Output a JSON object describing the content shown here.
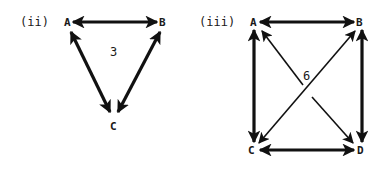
{
  "diagrams": [
    {
      "id": "ii",
      "label": "(ii)",
      "nodes": [
        {
          "name": "A",
          "x": 68,
          "y": 26
        },
        {
          "name": "B",
          "x": 163,
          "y": 26
        },
        {
          "name": "C",
          "x": 114,
          "y": 130
        }
      ],
      "edges": [
        {
          "from": "A",
          "to": "B",
          "bidirectional": true,
          "weight": "thick"
        },
        {
          "from": "A",
          "to": "C",
          "bidirectional": true,
          "weight": "thick"
        },
        {
          "from": "B",
          "to": "C",
          "bidirectional": true,
          "weight": "thick"
        }
      ],
      "center_number": "3"
    },
    {
      "id": "iii",
      "label": "(iii)",
      "nodes": [
        {
          "name": "A",
          "x": 254,
          "y": 26
        },
        {
          "name": "B",
          "x": 360,
          "y": 26
        },
        {
          "name": "C",
          "x": 252,
          "y": 154
        },
        {
          "name": "D",
          "x": 361,
          "y": 154
        }
      ],
      "edges": [
        {
          "from": "A",
          "to": "B",
          "bidirectional": true,
          "weight": "thick"
        },
        {
          "from": "A",
          "to": "C",
          "bidirectional": true,
          "weight": "thick"
        },
        {
          "from": "B",
          "to": "D",
          "bidirectional": true,
          "weight": "thick"
        },
        {
          "from": "C",
          "to": "D",
          "bidirectional": true,
          "weight": "thick"
        },
        {
          "from": "A",
          "to": "D",
          "bidirectional": true,
          "weight": "thin"
        },
        {
          "from": "B",
          "to": "C",
          "bidirectional": true,
          "weight": "thin"
        }
      ],
      "center_number": "6"
    }
  ],
  "colors": {
    "ink": "#111111",
    "background": "#ffffff"
  }
}
